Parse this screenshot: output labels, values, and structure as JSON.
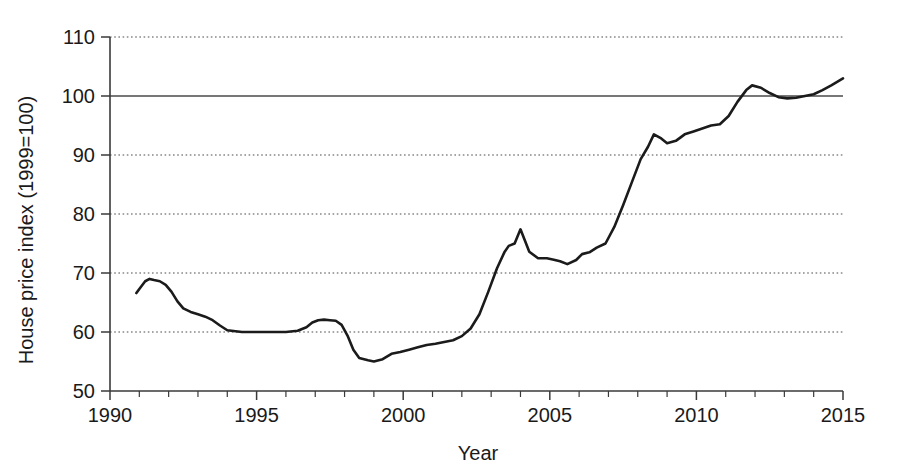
{
  "chart_data": {
    "type": "line",
    "title": "",
    "xlabel": "Year",
    "ylabel": "House price index (1999=100)",
    "xlim": [
      1990,
      2015
    ],
    "ylim": [
      50,
      110
    ],
    "xticks": [
      1990,
      1995,
      2000,
      2005,
      2010,
      2015
    ],
    "xtick_labels": [
      "1990",
      "1995",
      "2000",
      "2005",
      "2010",
      "2015"
    ],
    "xminor_tick_step": 1,
    "yticks": [
      50,
      60,
      70,
      80,
      90,
      100,
      110
    ],
    "ytick_labels": [
      "50",
      "60",
      "70",
      "80",
      "90",
      "100",
      "110"
    ],
    "grid": "horizontal-dotted",
    "reference_line": {
      "y": 100,
      "style": "solid",
      "label": "1999=100 baseline"
    },
    "legend": "none",
    "series": [
      {
        "name": "House price index",
        "color": "#1b1b1b",
        "x": [
          1990.9,
          1991.0,
          1991.2,
          1991.35,
          1991.5,
          1991.7,
          1991.9,
          1992.1,
          1992.3,
          1992.5,
          1992.75,
          1993.0,
          1993.25,
          1993.5,
          1993.75,
          1994.0,
          1994.5,
          1995.0,
          1995.5,
          1996.0,
          1996.4,
          1996.7,
          1996.9,
          1997.1,
          1997.3,
          1997.5,
          1997.7,
          1997.9,
          1998.1,
          1998.3,
          1998.5,
          1998.8,
          1999.0,
          1999.3,
          1999.6,
          1999.9,
          2000.2,
          2000.5,
          2000.8,
          2001.1,
          2001.4,
          2001.7,
          2002.0,
          2002.3,
          2002.6,
          2002.9,
          2003.2,
          2003.45,
          2003.6,
          2003.8,
          2004.0,
          2004.3,
          2004.6,
          2004.9,
          2005.1,
          2005.35,
          2005.6,
          2005.9,
          2006.1,
          2006.35,
          2006.6,
          2006.9,
          2007.2,
          2007.5,
          2007.8,
          2008.1,
          2008.35,
          2008.55,
          2008.8,
          2009.0,
          2009.3,
          2009.6,
          2009.9,
          2010.2,
          2010.5,
          2010.8,
          2011.1,
          2011.4,
          2011.7,
          2011.9,
          2012.2,
          2012.5,
          2012.8,
          2013.1,
          2013.4,
          2013.7,
          2014.0,
          2014.3,
          2014.6,
          2015.0
        ],
        "y": [
          66.6,
          67.3,
          68.6,
          69.0,
          68.8,
          68.6,
          68.0,
          66.8,
          65.2,
          64.0,
          63.4,
          63.0,
          62.6,
          62.0,
          61.1,
          60.3,
          60.0,
          60.0,
          60.0,
          60.0,
          60.2,
          60.8,
          61.6,
          62.0,
          62.1,
          62.0,
          61.9,
          61.2,
          59.4,
          57.0,
          55.6,
          55.2,
          55.0,
          55.4,
          56.3,
          56.6,
          57.0,
          57.4,
          57.8,
          58.0,
          58.3,
          58.6,
          59.3,
          60.6,
          63.0,
          66.8,
          70.8,
          73.5,
          74.6,
          75.0,
          77.4,
          73.6,
          72.5,
          72.5,
          72.3,
          72.0,
          71.5,
          72.2,
          73.2,
          73.5,
          74.3,
          75.0,
          77.8,
          81.5,
          85.4,
          89.3,
          91.4,
          93.5,
          92.8,
          92.0,
          92.4,
          93.5,
          94.0,
          94.5,
          95.0,
          95.2,
          96.6,
          99.0,
          101.0,
          101.8,
          101.4,
          100.5,
          99.8,
          99.6,
          99.7,
          100.0,
          100.3,
          101.0,
          101.8,
          103.0
        ]
      }
    ]
  },
  "axes": {
    "y_title": "House price index (1999=100)",
    "x_title": "Year"
  }
}
